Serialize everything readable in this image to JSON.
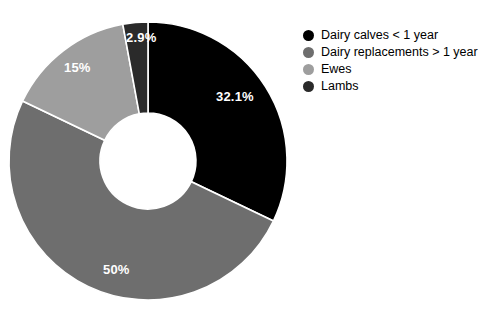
{
  "chart_data": {
    "type": "pie",
    "variant": "donut",
    "title": "",
    "subtitle": "",
    "xlabel": "",
    "ylabel": "",
    "grid": false,
    "legend_position": "right",
    "units": "percent",
    "hole_ratio": 0.345,
    "start_angle_deg": 0,
    "direction": "clockwise",
    "separator_color": "#ffffff",
    "background": "#ffffff",
    "categories": [
      "Dairy calves < 1 year",
      "Dairy replacements > 1 year",
      "Ewes",
      "Lambs"
    ],
    "values": [
      32.1,
      50,
      15,
      2.9
    ],
    "data_labels": [
      "32.1%",
      "50%",
      "15%",
      "2.9%"
    ],
    "colors": [
      "#000000",
      "#6e6e6e",
      "#9e9e9e",
      "#2a2a2a"
    ],
    "slices": [
      {
        "name": "Dairy calves < 1 year",
        "value": 32.1,
        "label": "32.1%",
        "color": "#000000",
        "label_color": "#ffffff",
        "start_deg": 0,
        "end_deg": 115.56
      },
      {
        "name": "Dairy replacements > 1 year",
        "value": 50,
        "label": "50%",
        "color": "#6e6e6e",
        "label_color": "#ffffff",
        "start_deg": 115.56,
        "end_deg": 295.56
      },
      {
        "name": "Ewes",
        "value": 15,
        "label": "15%",
        "color": "#9e9e9e",
        "label_color": "#ffffff",
        "start_deg": 295.56,
        "end_deg": 349.56
      },
      {
        "name": "Lambs",
        "value": 2.9,
        "label": "2.9%",
        "color": "#2a2a2a",
        "label_color": "#ffffff",
        "start_deg": 349.56,
        "end_deg": 360
      }
    ]
  },
  "legend": {
    "items": [
      {
        "label": "Dairy calves < 1 year",
        "color": "#000000"
      },
      {
        "label": "Dairy replacements > 1 year",
        "color": "#6e6e6e"
      },
      {
        "label": "Ewes",
        "color": "#9e9e9e"
      },
      {
        "label": "Lambs",
        "color": "#2a2a2a"
      }
    ]
  }
}
